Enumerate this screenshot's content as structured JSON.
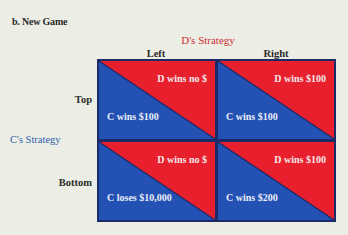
{
  "figure": {
    "title": "b. New Game",
    "column_player_label": "D's Strategy",
    "row_player_label": "C's Strategy",
    "columns": [
      "Left",
      "Right"
    ],
    "rows": [
      "Top",
      "Bottom"
    ],
    "colors": {
      "d_payoff_fill": "#e8202e",
      "c_payoff_fill": "#2451b4",
      "grid_border": "#1d2a68",
      "d_label_color": "#d02a36",
      "c_label_color": "#2e63b0",
      "background": "#eceee5"
    },
    "cells": {
      "top_left": {
        "d_payoff": "D wins no $",
        "c_payoff": "C wins $100"
      },
      "top_right": {
        "d_payoff": "D wins $100",
        "c_payoff": "C wins $100"
      },
      "bottom_left": {
        "d_payoff": "D wins no $",
        "c_payoff": "C loses $10,000"
      },
      "bottom_right": {
        "d_payoff": "D wins $100",
        "c_payoff": "C wins $200"
      }
    }
  }
}
